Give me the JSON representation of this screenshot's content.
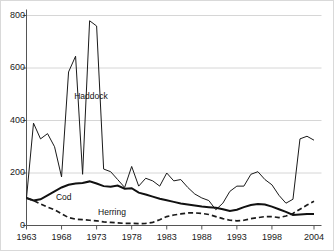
{
  "chart_data": {
    "type": "line",
    "title": "",
    "subtitle": "",
    "xlabel": "",
    "ylabel": "",
    "xlim": [
      1963,
      2004
    ],
    "ylim": [
      0,
      800
    ],
    "grid": true,
    "legend_position": "inline-annotations",
    "y_ticks": [
      0,
      200,
      400,
      600,
      800
    ],
    "x_ticks": [
      1963,
      1968,
      1973,
      1978,
      1983,
      1988,
      1993,
      1998,
      2004
    ],
    "x_tick_labels": [
      "1963",
      "1968",
      "1973",
      "1978",
      "1983",
      "1988",
      "1993",
      "1998",
      "2004"
    ],
    "y_tick_labels": [
      "0",
      "200",
      "400",
      "600",
      "800"
    ],
    "x": [
      1963,
      1964,
      1965,
      1966,
      1967,
      1968,
      1969,
      1970,
      1971,
      1972,
      1973,
      1974,
      1975,
      1976,
      1977,
      1978,
      1979,
      1980,
      1981,
      1982,
      1983,
      1984,
      1985,
      1986,
      1987,
      1988,
      1989,
      1990,
      1991,
      1992,
      1993,
      1994,
      1995,
      1996,
      1997,
      1998,
      1999,
      2000,
      2001,
      2002,
      2003,
      2004
    ],
    "series": [
      {
        "name": "Haddock",
        "style": "solid-thin",
        "color": "#1a1a1a",
        "label_x": 1969.8,
        "label_y": 490,
        "values": [
          105,
          390,
          330,
          350,
          300,
          185,
          585,
          645,
          195,
          780,
          760,
          215,
          205,
          175,
          145,
          225,
          150,
          180,
          170,
          150,
          200,
          170,
          175,
          145,
          120,
          105,
          95,
          60,
          85,
          130,
          150,
          150,
          195,
          205,
          175,
          155,
          115,
          85,
          100,
          330,
          340,
          325
        ]
      },
      {
        "name": "Cod",
        "style": "solid-thick",
        "color": "#111111",
        "label_x": 1967.2,
        "label_y": 105,
        "values": [
          105,
          95,
          100,
          115,
          130,
          145,
          155,
          160,
          162,
          168,
          160,
          150,
          148,
          152,
          140,
          142,
          125,
          118,
          110,
          102,
          96,
          90,
          84,
          80,
          76,
          72,
          70,
          68,
          62,
          55,
          60,
          70,
          78,
          82,
          80,
          72,
          62,
          52,
          40,
          42,
          44,
          44
        ]
      },
      {
        "name": "Herring",
        "style": "dashed",
        "color": "#1a1a1a",
        "label_x": 1973.2,
        "label_y": 48,
        "values": [
          105,
          95,
          82,
          70,
          60,
          45,
          30,
          24,
          22,
          20,
          18,
          14,
          12,
          10,
          8,
          8,
          7,
          8,
          12,
          22,
          34,
          40,
          44,
          48,
          48,
          46,
          42,
          34,
          26,
          20,
          18,
          20,
          26,
          30,
          34,
          34,
          30,
          36,
          46,
          62,
          78,
          92
        ]
      }
    ]
  },
  "axis": {
    "y_axis_name": "y-axis",
    "x_axis_name": "x-axis"
  }
}
